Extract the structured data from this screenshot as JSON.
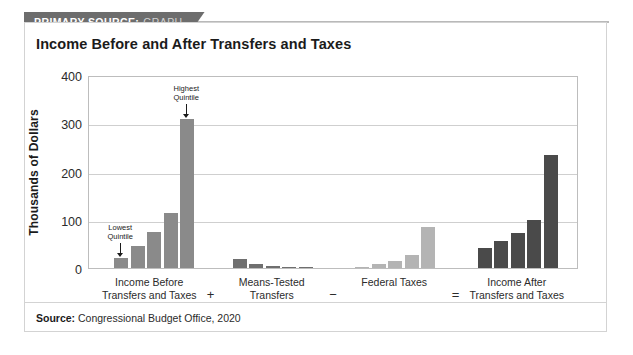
{
  "banner": {
    "label_strong": "PRIMARY SOURCE:",
    "label_light": "GRAPH"
  },
  "source_note": {
    "label": "Source:",
    "text": "Congressional Budget Office, 2020"
  },
  "colors": {
    "banner_bg": "#6d6d6d",
    "group_1": "#8a8a8a",
    "group_2": "#6f6f6f",
    "group_3": "#b4b4b4",
    "group_4": "#4a4a4a",
    "gridline": "#cfcfcf",
    "frame": "#bdbdbd"
  },
  "chart_data": {
    "type": "bar",
    "title": "Income Before and After Transfers and Taxes",
    "xlabel": "",
    "ylabel": "Thousands of Dollars",
    "ylim": [
      0,
      400
    ],
    "yticks": [
      0,
      100,
      200,
      300,
      400
    ],
    "grid": true,
    "legend": "none",
    "categories": [
      "Lowest Quintile",
      "Second Quintile",
      "Middle Quintile",
      "Fourth Quintile",
      "Highest Quintile"
    ],
    "groups": [
      {
        "name": "Income Before Transfers and Taxes",
        "label_lines": "Income Before\nTransfers and Taxes",
        "operator_after": "+",
        "color": "#8a8a8a",
        "values": [
          20,
          45,
          75,
          113,
          308
        ]
      },
      {
        "name": "Means-Tested Transfers",
        "label_lines": "Means-Tested\nTransfers",
        "operator_after": "−",
        "color": "#6f6f6f",
        "values": [
          18,
          8,
          5,
          3,
          2
        ]
      },
      {
        "name": "Federal Taxes",
        "label_lines": "Federal Taxes",
        "operator_after": "=",
        "color": "#b4b4b4",
        "values": [
          2,
          8,
          15,
          28,
          85
        ]
      },
      {
        "name": "Income After Transfers and Taxes",
        "label_lines": "Income After\nTransfers and Taxes",
        "operator_after": "",
        "color": "#4a4a4a",
        "values": [
          42,
          55,
          72,
          100,
          235
        ]
      }
    ],
    "annotations": [
      {
        "text": "Lowest\nQuintile",
        "group": 0,
        "bar": 0
      },
      {
        "text": "Highest\nQuintile",
        "group": 0,
        "bar": 4
      }
    ]
  }
}
